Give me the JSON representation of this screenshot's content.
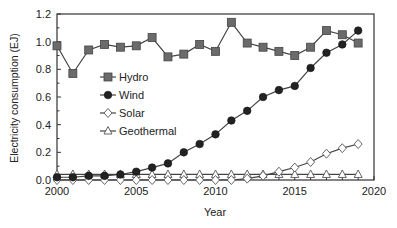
{
  "chart_data": {
    "type": "line",
    "title": "",
    "xlabel": "Year",
    "ylabel": "Electricity consumption (EJ)",
    "xlim": [
      2000,
      2020
    ],
    "ylim": [
      0.0,
      1.2
    ],
    "xticks": [
      "2000",
      "2005",
      "2010",
      "2015",
      "2020"
    ],
    "yticks": [
      "0.0",
      "0.2",
      "0.4",
      "0.6",
      "0.8",
      "1.0",
      "1.2"
    ],
    "grid": false,
    "legend_position": "inside upper-left",
    "x": [
      2000,
      2001,
      2002,
      2003,
      2004,
      2005,
      2006,
      2007,
      2008,
      2009,
      2010,
      2011,
      2012,
      2013,
      2014,
      2015,
      2016,
      2017,
      2018,
      2019
    ],
    "series": [
      {
        "name": "Hydro",
        "marker": "square",
        "values": [
          0.97,
          0.77,
          0.94,
          0.98,
          0.96,
          0.97,
          1.03,
          0.89,
          0.91,
          0.98,
          0.93,
          1.14,
          0.99,
          0.96,
          0.93,
          0.9,
          0.96,
          1.08,
          1.05,
          0.99
        ]
      },
      {
        "name": "Wind",
        "marker": "circle-filled",
        "values": [
          0.02,
          0.02,
          0.03,
          0.03,
          0.04,
          0.06,
          0.09,
          0.12,
          0.2,
          0.26,
          0.33,
          0.43,
          0.5,
          0.6,
          0.65,
          0.68,
          0.81,
          0.92,
          0.98,
          1.08
        ]
      },
      {
        "name": "Solar",
        "marker": "diamond-open",
        "values": [
          0.0,
          0.0,
          0.0,
          0.0,
          0.0,
          0.0,
          0.0,
          0.0,
          0.0,
          0.0,
          0.0,
          0.0,
          0.01,
          0.03,
          0.06,
          0.09,
          0.13,
          0.19,
          0.23,
          0.26
        ]
      },
      {
        "name": "Geothermal",
        "marker": "triangle-open",
        "values": [
          0.04,
          0.04,
          0.04,
          0.04,
          0.04,
          0.04,
          0.04,
          0.04,
          0.04,
          0.04,
          0.04,
          0.04,
          0.04,
          0.04,
          0.04,
          0.04,
          0.04,
          0.04,
          0.04,
          0.04
        ]
      }
    ]
  },
  "colors": {
    "axis": "#333333",
    "hydro_marker": "#6b6b6b",
    "wind_marker": "#222222",
    "line": "#444444",
    "open_marker_fill": "#ffffff"
  }
}
